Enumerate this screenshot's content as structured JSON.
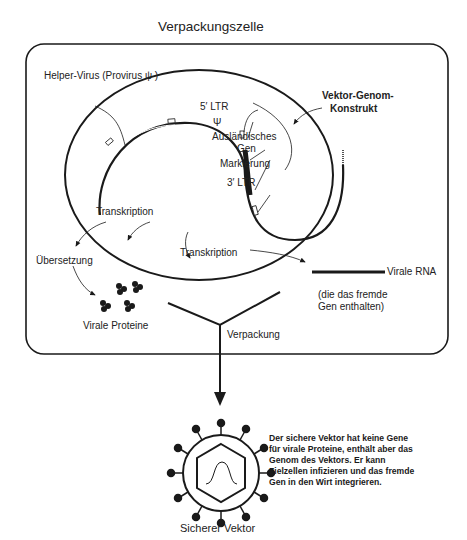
{
  "title": "Verpackungszelle",
  "labels": {
    "helper_virus": "Helper-Virus (Provirus ψ )",
    "ltr5": "5′ LTR",
    "psi": "Ψ",
    "foreign_gene_1": "Ausländisches",
    "foreign_gene_2": "Gen",
    "marker": "Markierung",
    "ltr3": "3′ LTR",
    "vector_construct_1": "Vektor-Genom-",
    "vector_construct_2": "Konstrukt",
    "transcription_left": "Transkription",
    "translation": "Übersetzung",
    "viral_proteins": "Virale Proteine",
    "transcription_center": "Transkription",
    "viral_rna": "Virale RNA",
    "viral_rna_note_1": "(die das fremde",
    "viral_rna_note_2": "Gen enthalten)",
    "packaging": "Verpackung",
    "safe_vector": "Sicherer Vektor"
  },
  "description": "Der sichere Vektor hat keine Gene für virale Proteine, enthält aber das Genom des Vektors. Er kann Zielzellen infizieren und das fremde Gen in den Wirt integrieren.",
  "colors": {
    "line": "#1a1a1a",
    "background": "#ffffff"
  }
}
